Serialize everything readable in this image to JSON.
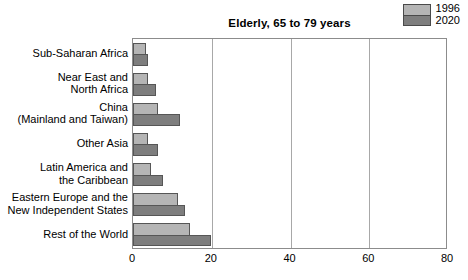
{
  "chart_data": {
    "type": "bar",
    "orientation": "horizontal",
    "title": "Elderly, 65 to 79 years",
    "xlabel": "",
    "ylabel": "",
    "xlim": [
      0,
      80
    ],
    "xticks": [
      0,
      20,
      40,
      60,
      80
    ],
    "xtick_labels": [
      "0",
      "20",
      "40",
      "60",
      "80"
    ],
    "grid": true,
    "grid_axis": "x",
    "legend_position": "top-right",
    "categories": [
      "Sub-Saharan Africa",
      "Near East and\nNorth Africa",
      "China\n(Mainland and Taiwan)",
      "Other Asia",
      "Latin America and\nthe Caribbean",
      "Eastern Europe and the\nNew Independent States",
      "Rest of the World"
    ],
    "category_lines": [
      [
        "Sub-Saharan Africa"
      ],
      [
        "Near East and",
        "North Africa"
      ],
      [
        "China",
        "(Mainland and Taiwan)"
      ],
      [
        "Other Asia"
      ],
      [
        "Latin America and",
        "the Caribbean"
      ],
      [
        "Eastern Europe and the",
        "New Independent States"
      ],
      [
        "Rest of the World"
      ]
    ],
    "series": [
      {
        "name": "1996",
        "color": "#b5b5b5",
        "values": [
          3.3,
          3.8,
          6.3,
          3.8,
          4.5,
          11.4,
          14.5
        ]
      },
      {
        "name": "2020",
        "color": "#7e7e7e",
        "values": [
          3.8,
          6.0,
          12.0,
          6.5,
          7.6,
          13.2,
          20.0
        ]
      }
    ]
  },
  "legend": {
    "entries": [
      {
        "label": "1996",
        "color": "#b5b5b5"
      },
      {
        "label": "2020",
        "color": "#7e7e7e"
      }
    ]
  },
  "axis": {
    "tick_labels": [
      "0",
      "20",
      "40",
      "60",
      "80"
    ]
  },
  "colors": {
    "series_1996": "#b5b5b5",
    "series_2020": "#7e7e7e",
    "frame": "#8c8c8c",
    "gridline": "#a8a8a8",
    "background": "#ffffff",
    "text": "#000000"
  }
}
